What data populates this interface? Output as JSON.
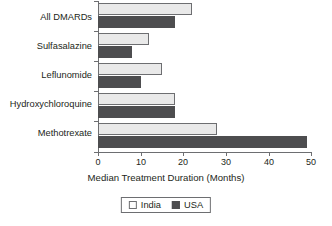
{
  "chart_data": {
    "type": "bar",
    "orientation": "horizontal",
    "title": "",
    "xlabel": "Median Treatment Duration (Months)",
    "ylabel": "",
    "xlim": [
      0,
      50
    ],
    "xticks": [
      0,
      10,
      20,
      30,
      40,
      50
    ],
    "grid": false,
    "legend_position": "bottom",
    "categories": [
      "All DMARDs",
      "Sulfasalazine",
      "Leflunomide",
      "Hydroxychloroquine",
      "Methotrexate"
    ],
    "series": [
      {
        "name": "India",
        "color": "#e9e9e9",
        "values": [
          22,
          12,
          15,
          18,
          28
        ]
      },
      {
        "name": "USA",
        "color": "#4d4d4f",
        "values": [
          18,
          8,
          10,
          18,
          49
        ]
      }
    ]
  },
  "axis": {
    "tick_labels": [
      "0",
      "10",
      "20",
      "30",
      "40",
      "50"
    ],
    "x_title": "Median Treatment Duration (Months)"
  },
  "legend": {
    "entries": [
      {
        "label": "India",
        "swatch": "light-square-swatch"
      },
      {
        "label": "USA",
        "swatch": "dark-square-swatch"
      }
    ]
  }
}
